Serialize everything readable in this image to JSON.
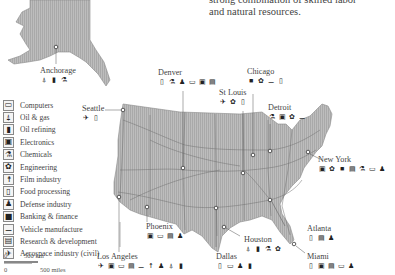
{
  "intro": {
    "line1": "strong combination of skilled labor",
    "line2": "and natural resources."
  },
  "legend": {
    "items": [
      {
        "icon": "computer-icon",
        "glyph": "▭",
        "label": "Computers"
      },
      {
        "icon": "oil-gas-icon",
        "glyph": "⍋",
        "label": "Oil & gas"
      },
      {
        "icon": "oil-refining-icon",
        "glyph": "▮",
        "label": "Oil refining"
      },
      {
        "icon": "electronics-icon",
        "glyph": "▣",
        "label": "Electronics"
      },
      {
        "icon": "chemicals-icon",
        "glyph": "⚗",
        "label": "Chemicals"
      },
      {
        "icon": "engineering-icon",
        "glyph": "✿",
        "label": "Engineering"
      },
      {
        "icon": "film-industry-icon",
        "glyph": "☨",
        "label": "Film industry"
      },
      {
        "icon": "food-processing-icon",
        "glyph": "▯",
        "label": "Food processing"
      },
      {
        "icon": "defense-industry-icon",
        "glyph": "♟",
        "label": "Defense industry"
      },
      {
        "icon": "banking-finance-icon",
        "glyph": "■",
        "label": "Banking & finance"
      },
      {
        "icon": "vehicle-manufacture-icon",
        "glyph": "⚊",
        "label": "Vehicle manufacture"
      },
      {
        "icon": "research-development-icon",
        "glyph": "▤",
        "label": "Research & development"
      },
      {
        "icon": "aerospace-icon",
        "glyph": "✈",
        "label": "Aerospace industry (civil)"
      }
    ]
  },
  "scale": {
    "km_zero": "0",
    "km_label": "500 km",
    "mi_zero": "0",
    "mi_label": "500 miles"
  },
  "cities": [
    {
      "name": "Anchorage",
      "icons": [
        "⍋",
        "▮",
        "⚗"
      ]
    },
    {
      "name": "Denver",
      "icons": [
        "▯",
        "⚗",
        "♟",
        "▭",
        "▣",
        "▤"
      ]
    },
    {
      "name": "Chicago",
      "icons": [
        "■",
        "✿",
        "⚊",
        "▯"
      ]
    },
    {
      "name": "St Louis",
      "icons": [
        "✈",
        "✿",
        "▯"
      ]
    },
    {
      "name": "Seattle",
      "icons": [
        "✈",
        "▯"
      ]
    },
    {
      "name": "Detroit",
      "icons": [
        "⚗",
        "▣",
        "✿",
        "⚊"
      ]
    },
    {
      "name": "New York",
      "icons": [
        "▣",
        "✿",
        "■",
        "▤",
        "⚗",
        "▭",
        "♟"
      ]
    },
    {
      "name": "Phoenix",
      "icons": [
        "▣",
        "▭",
        "▤",
        "♟"
      ]
    },
    {
      "name": "Atlanta",
      "icons": [
        "▯",
        "▤",
        "♟"
      ]
    },
    {
      "name": "Houston",
      "icons": [
        "⍋",
        "▮",
        "⚗",
        "✿"
      ]
    },
    {
      "name": "Los Angeles",
      "icons": [
        "✈",
        "▣",
        "▭",
        "▤",
        "⚊",
        "☨",
        "♟",
        "⍋",
        "▮"
      ]
    },
    {
      "name": "Dallas",
      "icons": [
        "▯",
        "▭",
        "♟",
        "▮"
      ]
    },
    {
      "name": "Miami",
      "icons": [
        "▯",
        "▣",
        "▤",
        "▭",
        "♟"
      ]
    }
  ],
  "colors": {
    "land": "#b8b8b8",
    "land_stroke": "#8a8a8a",
    "roads": "#6f6f6f",
    "text": "#444444"
  }
}
